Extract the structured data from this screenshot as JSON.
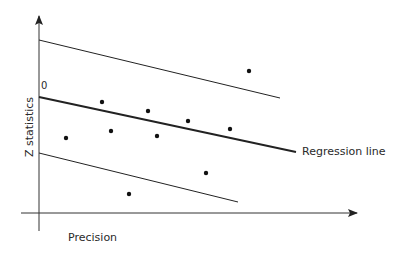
{
  "chart_data": {
    "type": "scatter",
    "title": "",
    "xlabel": "Precision",
    "ylabel": "Z statistics",
    "origin_label": "0",
    "grid": false,
    "legend": null,
    "annotations": [
      "Regression line"
    ],
    "axes_px": {
      "x_axis": {
        "x1": 21,
        "x2": 357,
        "y": 213
      },
      "y_axis": {
        "x": 39,
        "y1": 231,
        "y2": 16
      }
    },
    "lines": [
      {
        "name": "Upper confidence bound",
        "x1": 39,
        "y1": 40,
        "x2": 280,
        "y2": 98,
        "width": 1
      },
      {
        "name": "Regression line",
        "x1": 39,
        "y1": 97,
        "x2": 296,
        "y2": 152,
        "width": 2
      },
      {
        "name": "Lower confidence bound",
        "x1": 39,
        "y1": 153,
        "x2": 238,
        "y2": 202,
        "width": 1
      }
    ],
    "points_px": [
      {
        "x": 66,
        "y": 138
      },
      {
        "x": 102,
        "y": 102
      },
      {
        "x": 111,
        "y": 131
      },
      {
        "x": 129,
        "y": 194
      },
      {
        "x": 148,
        "y": 111
      },
      {
        "x": 157,
        "y": 136
      },
      {
        "x": 188,
        "y": 121
      },
      {
        "x": 206,
        "y": 173
      },
      {
        "x": 230,
        "y": 129
      },
      {
        "x": 249,
        "y": 71
      }
    ],
    "colors": {
      "axis": "#333333",
      "line": "#222222",
      "point": "#111111"
    }
  },
  "labels": {
    "x_axis": "Precision",
    "y_axis": "Z statistics",
    "regression": "Regression line",
    "origin": "0"
  }
}
